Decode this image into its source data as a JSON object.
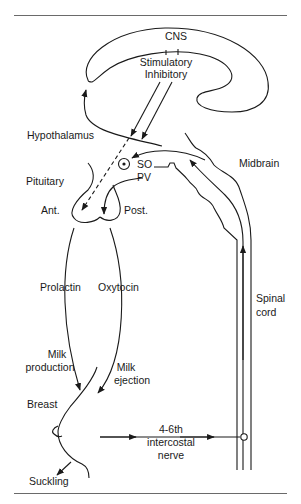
{
  "figure": {
    "labels": {
      "cns": "CNS",
      "stimulatory": "Stimulatory",
      "inhibitory": "Inhibitory",
      "hypothalamus": "Hypothalamus",
      "so": "SO",
      "pv": "PV",
      "midbrain": "Midbrain",
      "pituitary": "Pituitary",
      "ant": "Ant.",
      "post": "Post.",
      "prolactin": "Prolactin",
      "oxytocin": "Oxytocin",
      "spinal_line1": "Spinal",
      "spinal_line2": "cord",
      "milk_production_line1": "Milk",
      "milk_production_line2": "production",
      "milk_ejection_line1": "Milk",
      "milk_ejection_line2": "ejection",
      "breast": "Breast",
      "nerve_line1": "4-6th",
      "nerve_line2": "intercostal",
      "nerve_line3": "nerve",
      "suckling": "Suckling"
    },
    "caption": ""
  },
  "colors": {
    "ink": "#1a1a1a",
    "rule": "#6a6a6a",
    "background": "#ffffff"
  }
}
